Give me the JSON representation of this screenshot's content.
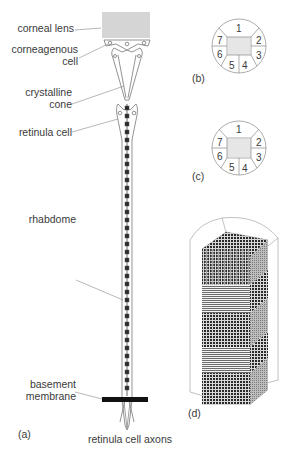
{
  "figure": {
    "panel_a": {
      "tag": "(a)",
      "labels": {
        "corneal_lens": "corneal lens",
        "corneagenous_cell_1": "corneagenous",
        "corneagenous_cell_2": "cell",
        "crystalline_cone_1": "crystalline",
        "crystalline_cone_2": "cone",
        "retinula_cell": "retinula cell",
        "rhabdome": "rhabdome",
        "basement_membrane_1": "basement",
        "basement_membrane_2": "membrane",
        "retinula_cell_axons": "retinula cell axons"
      }
    },
    "panel_b": {
      "tag": "(b)",
      "cell_numbers": [
        "1",
        "2",
        "3",
        "4",
        "5",
        "6",
        "7"
      ]
    },
    "panel_c": {
      "tag": "(c)",
      "cell_numbers": [
        "1",
        "2",
        "3",
        "4",
        "5",
        "6",
        "7"
      ]
    },
    "panel_d": {
      "tag": "(d)"
    }
  }
}
